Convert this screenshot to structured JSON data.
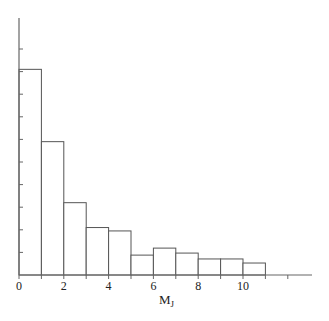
{
  "chart_data": {
    "type": "bar",
    "subtype": "histogram",
    "title": "",
    "xlabel": "M",
    "xlabel_subscript": "J",
    "ylabel": "",
    "bin_edges": [
      0,
      1,
      2,
      3,
      4,
      5,
      6,
      7,
      8,
      9,
      10,
      11
    ],
    "categories": [
      "0-1",
      "1-2",
      "2-3",
      "3-4",
      "4-5",
      "5-6",
      "6-7",
      "7-8",
      "8-9",
      "9-10",
      "10-11"
    ],
    "values": [
      9.1,
      5.9,
      3.2,
      2.1,
      1.95,
      0.88,
      1.19,
      0.97,
      0.71,
      0.71,
      0.53
    ],
    "xlim": [
      0,
      13
    ],
    "ylim": [
      0,
      11.4
    ],
    "x_ticks": [
      0,
      1,
      2,
      3,
      4,
      5,
      6,
      7,
      8,
      9,
      10,
      11,
      12
    ],
    "x_tick_labels": [
      "0",
      "2",
      "4",
      "6",
      "8",
      "10"
    ],
    "x_tick_label_values": [
      0,
      2,
      4,
      6,
      8,
      10
    ],
    "y_ticks": [
      1,
      2,
      3,
      4,
      5,
      6,
      7,
      8,
      9,
      10
    ],
    "y_tick_labels": [],
    "grid": false,
    "legend": null,
    "bar_fill": "#ffffff",
    "bar_stroke": "#555555"
  }
}
